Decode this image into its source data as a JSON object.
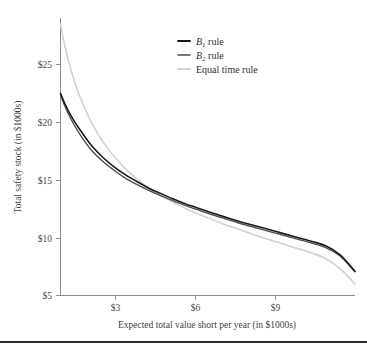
{
  "figure": {
    "background_color": "#ffffff",
    "footer_rule_color": "#2b2b2b"
  },
  "chart_data": {
    "type": "line",
    "title": "",
    "xlabel": "Expected total value short per year (in $1000s)",
    "ylabel": "Total safety stock (in $1000s)",
    "xlim": [
      0.95,
      11.0
    ],
    "ylim": [
      5,
      28.5
    ],
    "xticks": [
      3,
      6,
      9
    ],
    "xtick_labels": [
      "$3",
      "$6",
      "$9"
    ],
    "yticks": [
      5,
      10,
      15,
      20,
      25
    ],
    "ytick_labels": [
      "$5",
      "$10",
      "$15",
      "$20",
      "$25"
    ],
    "grid": false,
    "legend_position": "top-right",
    "series": [
      {
        "name": "B1 rule",
        "label_main": "B",
        "label_sub": "1",
        "label_tail": " rule",
        "color": "#1a1a1a",
        "width": 1.6,
        "x": [
          0.95,
          1.1,
          1.3,
          1.6,
          2.0,
          2.4,
          2.8,
          3.2,
          3.6,
          4.0,
          4.4,
          4.8,
          5.2,
          5.6,
          6.0,
          6.5,
          7.0,
          7.5,
          8.0,
          8.5,
          9.0,
          9.5,
          10.0,
          10.5,
          11.0
        ],
        "y": [
          22.5,
          21.6,
          20.6,
          19.4,
          18.0,
          16.95,
          16.1,
          15.4,
          14.8,
          14.25,
          13.8,
          13.35,
          12.95,
          12.6,
          12.25,
          11.85,
          11.45,
          11.1,
          10.75,
          10.4,
          10.05,
          9.7,
          9.3,
          8.5,
          7.1
        ]
      },
      {
        "name": "B2 rule",
        "label_main": "B",
        "label_sub": "2",
        "label_tail": " rule",
        "color": "#4f4f4f",
        "width": 1.4,
        "x": [
          0.95,
          1.1,
          1.3,
          1.6,
          2.0,
          2.4,
          2.8,
          3.2,
          3.6,
          4.0,
          4.4,
          4.8,
          5.2,
          5.6,
          6.0,
          6.5,
          7.0,
          7.5,
          8.0,
          8.5,
          9.0,
          9.5,
          10.0,
          10.5,
          11.0
        ],
        "y": [
          22.4,
          21.4,
          20.3,
          19.0,
          17.6,
          16.6,
          15.8,
          15.1,
          14.55,
          14.05,
          13.6,
          13.2,
          12.8,
          12.45,
          12.1,
          11.7,
          11.3,
          10.95,
          10.6,
          10.25,
          9.9,
          9.55,
          9.15,
          8.4,
          7.05
        ]
      },
      {
        "name": "Equal time rule",
        "label_main": "Equal time rule",
        "label_sub": "",
        "label_tail": "",
        "color": "#d2d2d2",
        "width": 1.6,
        "x": [
          0.95,
          1.1,
          1.3,
          1.6,
          2.0,
          2.4,
          2.8,
          3.2,
          3.6,
          4.0,
          4.4,
          4.8,
          5.2,
          5.6,
          6.0,
          6.5,
          7.0,
          7.5,
          8.0,
          8.5,
          9.0,
          9.5,
          10.0,
          10.5,
          11.0
        ],
        "y": [
          28.5,
          26.6,
          24.6,
          22.3,
          20.0,
          18.3,
          17.0,
          15.9,
          15.0,
          14.2,
          13.6,
          13.05,
          12.55,
          12.1,
          11.7,
          11.2,
          10.75,
          10.3,
          9.9,
          9.5,
          9.1,
          8.7,
          8.2,
          7.3,
          6.0
        ]
      }
    ]
  },
  "legend": {
    "entries": [
      {
        "text": "B",
        "sub": "1",
        "tail": " rule",
        "color": "#1a1a1a"
      },
      {
        "text": "B",
        "sub": "2",
        "tail": " rule",
        "color": "#4f4f4f"
      },
      {
        "text": "Equal time rule",
        "sub": "",
        "tail": "",
        "color": "#d2d2d2"
      }
    ]
  }
}
